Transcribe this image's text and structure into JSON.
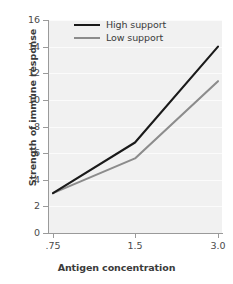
{
  "chart_data": {
    "type": "line",
    "title": "",
    "xlabel": "Antigen concentration",
    "ylabel": "Strength of immune response",
    "categories": [
      ".75",
      "1.5",
      "3.0"
    ],
    "x": [
      0.75,
      1.5,
      3.0
    ],
    "series": [
      {
        "name": "High support",
        "values": [
          3.0,
          6.8,
          14.0
        ],
        "color": "#1a1a1a"
      },
      {
        "name": "Low support",
        "values": [
          3.0,
          5.6,
          11.4
        ],
        "color": "#8c8c8c"
      }
    ],
    "ylim": [
      0,
      16
    ],
    "yticks": [
      0,
      2,
      4,
      6,
      8,
      10,
      12,
      14,
      16
    ],
    "ytick_labels": [
      "0",
      "2",
      "4",
      "6",
      "8",
      "10",
      "12",
      "14",
      "16"
    ],
    "xtick_labels": [
      ".75",
      "1.5",
      "3.0"
    ],
    "grid": true,
    "grid_axis": "y",
    "legend_position": "upper left",
    "plot_background": "#f1f1f1",
    "figure_background": "#ffffff",
    "axis_color": "#9a9a9a",
    "text_color": "#3b3b3b"
  },
  "legend": {
    "entries": [
      {
        "label": "High support"
      },
      {
        "label": "Low support"
      }
    ]
  }
}
